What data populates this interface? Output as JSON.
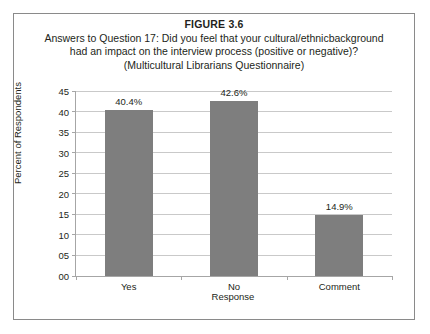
{
  "figure": {
    "number_label": "FIGURE 3.6",
    "title_lines": [
      "Answers to Question 17: Did you feel that your cultural/ethnicbackground",
      "had an impact on the interview process (positive or negative)?",
      "(Multicultural Librarians Questionnaire)"
    ]
  },
  "chart_data": {
    "type": "bar",
    "title": "FIGURE 3.6",
    "subtitle": "Answers to Question 17: Did you feel that your cultural/ethnicbackground had an impact on the interview process (positive or negative)? (Multicultural Librarians Questionnaire)",
    "categories": [
      "Yes",
      "No",
      "Comment"
    ],
    "values": [
      40.4,
      42.6,
      14.9
    ],
    "data_labels": [
      "40.4%",
      "42.6%",
      "14.9%"
    ],
    "xlabel": "Response",
    "ylabel": "Percent of Respondents",
    "ylim": [
      0,
      45
    ],
    "ytick_step": 5,
    "ytick_labels": [
      "00",
      "05",
      "10",
      "15",
      "20",
      "25",
      "30",
      "35",
      "40",
      "45"
    ],
    "ytick_values": [
      0,
      5,
      10,
      15,
      20,
      25,
      30,
      35,
      40,
      45
    ],
    "grid": true,
    "grid_axis": "y",
    "legend": false,
    "bar_color": "#7e7e7e",
    "gridline_color": "#c9c9c9",
    "axis_color": "#a6a6a6",
    "background_color": "#ffffff"
  }
}
